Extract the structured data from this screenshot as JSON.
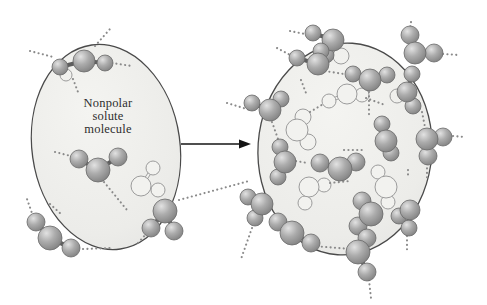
{
  "diagram": {
    "label": {
      "lines": [
        "Nonpolar",
        "solute",
        "molecule"
      ]
    },
    "colors": {
      "background": "#ffffff",
      "ellipse_fill_light": "#f4f4f1",
      "ellipse_fill_dark": "#e3e3e1",
      "ellipse_stroke": "#4a4a4a",
      "sphere_highlight": "#e2e2e2",
      "sphere_mid": "#acacac",
      "sphere_dark": "#7d7d7d",
      "sphere_stroke": "#6a6a6a",
      "bond": "#5e5e5e",
      "ghost_fill": "#f2f2ef",
      "ghost_stroke": "#9c9c9c",
      "hbond": "#8a8a8a",
      "arrow": "#141414",
      "label_text": "#2e2e2e"
    },
    "arrow": {
      "x1": 181,
      "y1": 144,
      "x2": 239,
      "y2": 144,
      "tip_x": 251,
      "half_h": 4.5
    },
    "left_panel": {
      "ellipse": {
        "cx": 106,
        "cy": 147,
        "rx": 74,
        "ry": 103,
        "rotate": -8
      },
      "ghost_circles": [
        [
          66,
          75,
          6
        ]
      ],
      "ghost_waters": [
        {
          "o": [
            141,
            186
          ],
          "ro": 10,
          "rh": 7,
          "h1": [
            153,
            168
          ],
          "h2": [
            158,
            190
          ]
        }
      ],
      "hbonds": [
        [
          95,
          46,
          110,
          29
        ],
        [
          30,
          51,
          53,
          57
        ],
        [
          112,
          63,
          132,
          66
        ],
        [
          73,
          79,
          78,
          92
        ],
        [
          55,
          152,
          71,
          156
        ],
        [
          104,
          182,
          127,
          210
        ],
        [
          33,
          216,
          27,
          199
        ],
        [
          50,
          204,
          61,
          214
        ],
        [
          83,
          249,
          110,
          248
        ],
        [
          147,
          233,
          137,
          244
        ],
        [
          179,
          200,
          249,
          181
        ],
        [
          227,
          103,
          250,
          110
        ]
      ],
      "waters": [
        {
          "o": [
            84,
            61
          ],
          "ro": 11,
          "rh": 8,
          "h1": [
            60,
            67
          ],
          "h2": [
            105,
            63
          ]
        },
        {
          "o": [
            98,
            170
          ],
          "ro": 12,
          "rh": 9,
          "h1": [
            79,
            159
          ],
          "h2": [
            118,
            157
          ]
        },
        {
          "o": [
            50,
            238
          ],
          "ro": 12,
          "rh": 9,
          "h1": [
            36,
            222
          ],
          "h2": [
            71,
            248
          ]
        },
        {
          "o": [
            165,
            211
          ],
          "ro": 12,
          "rh": 9,
          "h1": [
            151,
            228
          ],
          "h2": [
            174,
            231
          ]
        }
      ]
    },
    "right_panel": {
      "ellipse": {
        "cx": 345,
        "cy": 149,
        "rx": 87,
        "ry": 106,
        "rotate": 4
      },
      "ghost_circles": [
        [
          341,
          56,
          8
        ],
        [
          397,
          96,
          7
        ]
      ],
      "ghost_waters": [
        {
          "o": [
            347,
            94
          ],
          "ro": 10,
          "rh": 7,
          "h1": [
            329,
            101
          ],
          "h2": [
            362,
            95
          ]
        },
        {
          "o": [
            297,
            130
          ],
          "ro": 11,
          "rh": 8,
          "h1": [
            303,
            117
          ],
          "h2": [
            308,
            142
          ]
        },
        {
          "o": [
            309,
            187
          ],
          "ro": 10,
          "rh": 7,
          "h1": [
            324,
            185
          ],
          "h2": [
            305,
            203
          ]
        },
        {
          "o": [
            386,
            187
          ],
          "ro": 11,
          "rh": 7,
          "h1": [
            378,
            172
          ],
          "h2": [
            388,
            202
          ]
        }
      ],
      "hbonds": [
        [
          290,
          31,
          305,
          34
        ],
        [
          411,
          22,
          410,
          29
        ],
        [
          443,
          54,
          459,
          55
        ],
        [
          277,
          48,
          292,
          56
        ],
        [
          325,
          71,
          344,
          74
        ],
        [
          369,
          92,
          369,
          118
        ],
        [
          272,
          122,
          278,
          139
        ],
        [
          296,
          161,
          308,
          163
        ],
        [
          301,
          80,
          306,
          93
        ],
        [
          453,
          136,
          465,
          137
        ],
        [
          427,
          164,
          427,
          178
        ],
        [
          422,
          112,
          425,
          127
        ],
        [
          408,
          170,
          408,
          178
        ],
        [
          407,
          236,
          407,
          250
        ],
        [
          369,
          280,
          371,
          298
        ],
        [
          313,
          246,
          351,
          249
        ],
        [
          252,
          228,
          241,
          259
        ],
        [
          366,
          98,
          385,
          105
        ],
        [
          310,
          112,
          325,
          103
        ],
        [
          330,
          183,
          350,
          181
        ],
        [
          344,
          150,
          364,
          150
        ]
      ],
      "waters": [
        {
          "o": [
            333,
            40
          ],
          "ro": 11,
          "rh": 8,
          "h1": [
            313,
            33
          ],
          "h2": [
            326,
            55
          ]
        },
        {
          "o": [
            415,
            53
          ],
          "ro": 11,
          "rh": 9,
          "h1": [
            410,
            35
          ],
          "h2": [
            434,
            53
          ]
        },
        {
          "o": [
            318,
            64
          ],
          "ro": 11,
          "rh": 8,
          "h1": [
            321,
            51
          ],
          "h2": [
            297,
            58
          ]
        },
        {
          "o": [
            370,
            80
          ],
          "ro": 11,
          "rh": 8,
          "h1": [
            353,
            74
          ],
          "h2": [
            387,
            75
          ]
        },
        {
          "o": [
            270,
            110
          ],
          "ro": 11,
          "rh": 8,
          "h1": [
            252,
            103
          ],
          "h2": [
            281,
            99
          ]
        },
        {
          "o": [
            285,
            162
          ],
          "ro": 11,
          "rh": 8,
          "h1": [
            280,
            147
          ],
          "h2": [
            278,
            177
          ]
        },
        {
          "o": [
            407,
            92
          ],
          "ro": 10,
          "rh": 8,
          "h1": [
            412,
            74
          ],
          "h2": [
            413,
            106
          ]
        },
        {
          "o": [
            386,
            141
          ],
          "ro": 11,
          "rh": 8,
          "h1": [
            382,
            124
          ],
          "h2": [
            391,
            153
          ]
        },
        {
          "o": [
            427,
            139
          ],
          "ro": 11,
          "rh": 9,
          "h1": [
            443,
            137
          ],
          "h2": [
            428,
            156
          ]
        },
        {
          "o": [
            340,
            169
          ],
          "ro": 12,
          "rh": 9,
          "h1": [
            320,
            163
          ],
          "h2": [
            356,
            162
          ]
        },
        {
          "o": [
            371,
            214
          ],
          "ro": 12,
          "rh": 9,
          "h1": [
            362,
            201
          ],
          "h2": [
            358,
            226
          ]
        },
        {
          "o": [
            410,
            210
          ],
          "ro": 10,
          "rh": 8,
          "h1": [
            399,
            216
          ],
          "h2": [
            409,
            228
          ]
        },
        {
          "o": [
            358,
            252
          ],
          "ro": 12,
          "rh": 9,
          "h1": [
            367,
            238
          ],
          "h2": [
            367,
            272
          ]
        },
        {
          "o": [
            292,
            233
          ],
          "ro": 12,
          "rh": 9,
          "h1": [
            278,
            222
          ],
          "h2": [
            311,
            243
          ]
        },
        {
          "o": [
            262,
            204
          ],
          "ro": 11,
          "rh": 8,
          "h1": [
            248,
            197
          ],
          "h2": [
            255,
            218
          ]
        }
      ]
    }
  }
}
